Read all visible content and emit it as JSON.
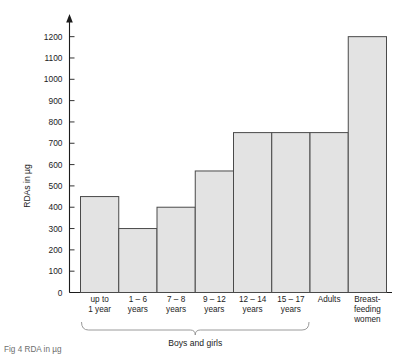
{
  "chart_data": {
    "type": "bar",
    "title": "",
    "xlabel": "",
    "ylabel": "RDAs in µg",
    "categories": [
      "up to\n1 year",
      "1 – 6\nyears",
      "7 – 8\nyears",
      "9 – 12\nyears",
      "12 – 14\nyears",
      "15 – 17\nyears",
      "Adults",
      "Breast-\nfeeding\nwomen"
    ],
    "category_lines": [
      [
        "up to",
        "1 year"
      ],
      [
        "1 – 6",
        "years"
      ],
      [
        "7 – 8",
        "years"
      ],
      [
        "9 – 12",
        "years"
      ],
      [
        "12 – 14",
        "years"
      ],
      [
        "15 – 17",
        "years"
      ],
      [
        "Adults"
      ],
      [
        "Breast-",
        "feeding",
        "women"
      ]
    ],
    "values": [
      450,
      300,
      400,
      570,
      750,
      750,
      750,
      1200
    ],
    "ylim": [
      0,
      1250
    ],
    "ytick_values": [
      0,
      100,
      200,
      300,
      400,
      500,
      600,
      700,
      800,
      900,
      1000,
      1100,
      1200
    ],
    "ytick_labels": [
      "0",
      "100",
      "200",
      "300",
      "400",
      "500",
      "600",
      "700",
      "800",
      "900",
      "1000",
      "1100",
      "1200"
    ],
    "grid": false,
    "legend": "none",
    "bar_fill_color": "#e3e3e3",
    "bar_edge_color": "#4a4a4a",
    "axis_color": "#1c1c1c"
  },
  "annotations": {
    "group_brace_label": "Boys and girls",
    "group_brace_span": [
      0,
      5
    ]
  },
  "caption": {
    "text": "Fig 4  RDA in µg"
  }
}
